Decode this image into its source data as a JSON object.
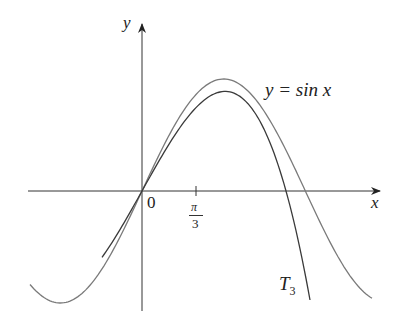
{
  "chart_data": {
    "type": "line",
    "title": "",
    "xlabel": "x",
    "ylabel": "y",
    "x_ticks": [
      {
        "value": 1.0472,
        "label": "π/3"
      }
    ],
    "origin_label": "0",
    "series": [
      {
        "name": "y = sin x",
        "function": "sin(x)",
        "x_range": [
          -2.15,
          4.45
        ],
        "color": "#777777"
      },
      {
        "name": "T3",
        "function": "x - x^3/6",
        "x_range": [
          -0.77,
          3.23
        ],
        "color": "#444444"
      }
    ],
    "annotations": [
      {
        "text": "y = sin x",
        "attached_to": "y = sin x"
      },
      {
        "text": "T3",
        "attached_to": "T3"
      }
    ],
    "grid": false,
    "legend": "none"
  },
  "labels": {
    "y_axis": "y",
    "x_axis": "x",
    "origin": "0",
    "tick_num": "π",
    "tick_den": "3",
    "sin_label": "y = sin x",
    "t3_main": "T",
    "t3_sub": "3"
  }
}
